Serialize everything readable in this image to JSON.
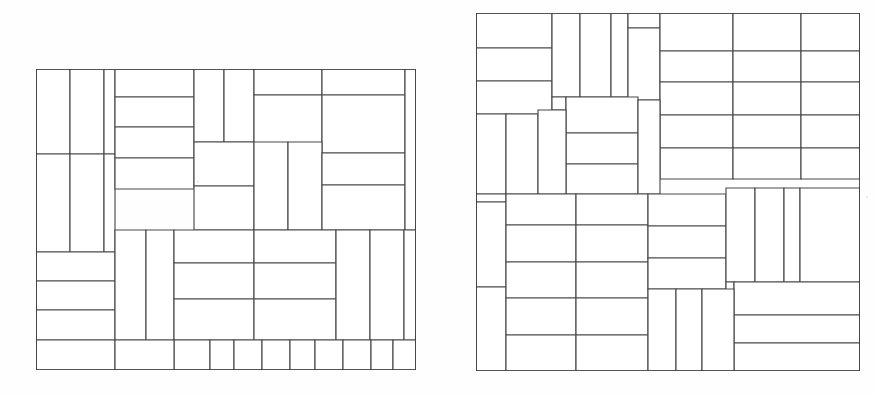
{
  "page": {
    "background_color": "#fefefe",
    "line_color": "#4a4a4a",
    "outline_color": "#3a3a3a",
    "fill_color": "#ffffff",
    "width": 876,
    "height": 395
  },
  "figures": [
    {
      "name": "left-packing",
      "label": "",
      "frame": {
        "x": 36,
        "y": 69,
        "width": 380,
        "height": 301
      },
      "view": {
        "width": 380,
        "height": 301
      },
      "piece_count": 38,
      "pieces": [
        {
          "x": 0,
          "y": 0,
          "w": 34,
          "h": 85
        },
        {
          "x": 34,
          "y": 0,
          "w": 34,
          "h": 85
        },
        {
          "x": 68,
          "y": 0,
          "w": 11,
          "h": 85
        },
        {
          "x": 0,
          "y": 85,
          "w": 34,
          "h": 98
        },
        {
          "x": 34,
          "y": 85,
          "w": 34,
          "h": 98
        },
        {
          "x": 68,
          "y": 85,
          "w": 11,
          "h": 98
        },
        {
          "x": 79,
          "y": 0,
          "w": 79,
          "h": 28
        },
        {
          "x": 79,
          "y": 28,
          "w": 79,
          "h": 30
        },
        {
          "x": 79,
          "y": 58,
          "w": 79,
          "h": 31
        },
        {
          "x": 79,
          "y": 89,
          "w": 79,
          "h": 31
        },
        {
          "x": 158,
          "y": 0,
          "w": 30,
          "h": 73
        },
        {
          "x": 188,
          "y": 0,
          "w": 30,
          "h": 73
        },
        {
          "x": 218,
          "y": 0,
          "w": 68,
          "h": 26
        },
        {
          "x": 218,
          "y": 26,
          "w": 68,
          "h": 58
        },
        {
          "x": 286,
          "y": 0,
          "w": 83,
          "h": 26
        },
        {
          "x": 286,
          "y": 26,
          "w": 83,
          "h": 58
        },
        {
          "x": 158,
          "y": 73,
          "w": 60,
          "h": 44
        },
        {
          "x": 158,
          "y": 117,
          "w": 60,
          "h": 44
        },
        {
          "x": 218,
          "y": 73,
          "w": 34,
          "h": 88
        },
        {
          "x": 252,
          "y": 73,
          "w": 34,
          "h": 88
        },
        {
          "x": 286,
          "y": 84,
          "w": 83,
          "h": 32
        },
        {
          "x": 286,
          "y": 116,
          "w": 83,
          "h": 45
        },
        {
          "x": 369,
          "y": 0,
          "w": 11,
          "h": 161
        },
        {
          "x": 0,
          "y": 183,
          "w": 79,
          "h": 29
        },
        {
          "x": 0,
          "y": 212,
          "w": 79,
          "h": 29
        },
        {
          "x": 0,
          "y": 241,
          "w": 79,
          "h": 30
        },
        {
          "x": 0,
          "y": 271,
          "w": 79,
          "h": 30
        },
        {
          "x": 79,
          "y": 161,
          "w": 31,
          "h": 110
        },
        {
          "x": 110,
          "y": 161,
          "w": 28,
          "h": 110
        },
        {
          "x": 138,
          "y": 161,
          "w": 80,
          "h": 33
        },
        {
          "x": 138,
          "y": 194,
          "w": 80,
          "h": 36
        },
        {
          "x": 138,
          "y": 230,
          "w": 80,
          "h": 41
        },
        {
          "x": 218,
          "y": 161,
          "w": 82,
          "h": 33
        },
        {
          "x": 218,
          "y": 194,
          "w": 82,
          "h": 36
        },
        {
          "x": 218,
          "y": 230,
          "w": 82,
          "h": 41
        },
        {
          "x": 300,
          "y": 161,
          "w": 34,
          "h": 110
        },
        {
          "x": 334,
          "y": 161,
          "w": 34,
          "h": 110
        },
        {
          "x": 368,
          "y": 161,
          "w": 12,
          "h": 110
        },
        {
          "x": 138,
          "y": 271,
          "w": 36,
          "h": 30
        },
        {
          "x": 174,
          "y": 271,
          "w": 24,
          "h": 30
        },
        {
          "x": 198,
          "y": 271,
          "w": 28,
          "h": 30
        },
        {
          "x": 226,
          "y": 271,
          "w": 28,
          "h": 30
        },
        {
          "x": 254,
          "y": 271,
          "w": 25,
          "h": 30
        },
        {
          "x": 279,
          "y": 271,
          "w": 28,
          "h": 30
        },
        {
          "x": 307,
          "y": 271,
          "w": 28,
          "h": 30
        },
        {
          "x": 335,
          "y": 271,
          "w": 22,
          "h": 30
        },
        {
          "x": 357,
          "y": 271,
          "w": 23,
          "h": 30
        },
        {
          "x": 79,
          "y": 271,
          "w": 59,
          "h": 30
        }
      ]
    },
    {
      "name": "right-packing",
      "label": "",
      "frame": {
        "x": 476,
        "y": 13,
        "width": 384,
        "height": 358
      },
      "view": {
        "width": 384,
        "height": 358
      },
      "piece_count": 44,
      "pieces": [
        {
          "x": 0,
          "y": 0,
          "w": 76,
          "h": 35
        },
        {
          "x": 0,
          "y": 35,
          "w": 76,
          "h": 33
        },
        {
          "x": 0,
          "y": 68,
          "w": 76,
          "h": 33
        },
        {
          "x": 76,
          "y": 0,
          "w": 28,
          "h": 84
        },
        {
          "x": 104,
          "y": 0,
          "w": 31,
          "h": 84
        },
        {
          "x": 135,
          "y": 0,
          "w": 17,
          "h": 84
        },
        {
          "x": 152,
          "y": 0,
          "w": 32,
          "h": 15
        },
        {
          "x": 152,
          "y": 15,
          "w": 32,
          "h": 72
        },
        {
          "x": 184,
          "y": 0,
          "w": 73,
          "h": 38
        },
        {
          "x": 257,
          "y": 0,
          "w": 68,
          "h": 38
        },
        {
          "x": 325,
          "y": 0,
          "w": 59,
          "h": 38
        },
        {
          "x": 184,
          "y": 38,
          "w": 73,
          "h": 31
        },
        {
          "x": 257,
          "y": 38,
          "w": 68,
          "h": 31
        },
        {
          "x": 325,
          "y": 38,
          "w": 59,
          "h": 31
        },
        {
          "x": 184,
          "y": 69,
          "w": 73,
          "h": 33
        },
        {
          "x": 257,
          "y": 69,
          "w": 68,
          "h": 33
        },
        {
          "x": 325,
          "y": 69,
          "w": 59,
          "h": 33
        },
        {
          "x": 184,
          "y": 102,
          "w": 73,
          "h": 33
        },
        {
          "x": 257,
          "y": 102,
          "w": 68,
          "h": 33
        },
        {
          "x": 325,
          "y": 102,
          "w": 59,
          "h": 33
        },
        {
          "x": 184,
          "y": 135,
          "w": 73,
          "h": 31
        },
        {
          "x": 257,
          "y": 135,
          "w": 68,
          "h": 31
        },
        {
          "x": 325,
          "y": 135,
          "w": 59,
          "h": 31
        },
        {
          "x": 76,
          "y": 84,
          "w": 14,
          "h": 13
        },
        {
          "x": 90,
          "y": 84,
          "w": 72,
          "h": 36
        },
        {
          "x": 90,
          "y": 120,
          "w": 72,
          "h": 31
        },
        {
          "x": 90,
          "y": 151,
          "w": 72,
          "h": 30
        },
        {
          "x": 162,
          "y": 87,
          "w": 22,
          "h": 94
        },
        {
          "x": 0,
          "y": 101,
          "w": 30,
          "h": 80
        },
        {
          "x": 30,
          "y": 101,
          "w": 32,
          "h": 80
        },
        {
          "x": 62,
          "y": 97,
          "w": 28,
          "h": 84
        },
        {
          "x": 0,
          "y": 181,
          "w": 30,
          "h": 8
        },
        {
          "x": 0,
          "y": 189,
          "w": 30,
          "h": 85
        },
        {
          "x": 0,
          "y": 274,
          "w": 30,
          "h": 84
        },
        {
          "x": 30,
          "y": 181,
          "w": 70,
          "h": 31
        },
        {
          "x": 100,
          "y": 181,
          "w": 72,
          "h": 31
        },
        {
          "x": 30,
          "y": 212,
          "w": 70,
          "h": 37
        },
        {
          "x": 100,
          "y": 212,
          "w": 72,
          "h": 37
        },
        {
          "x": 30,
          "y": 249,
          "w": 70,
          "h": 36
        },
        {
          "x": 100,
          "y": 249,
          "w": 72,
          "h": 36
        },
        {
          "x": 30,
          "y": 285,
          "w": 70,
          "h": 37
        },
        {
          "x": 100,
          "y": 285,
          "w": 72,
          "h": 37
        },
        {
          "x": 30,
          "y": 322,
          "w": 70,
          "h": 36
        },
        {
          "x": 100,
          "y": 322,
          "w": 72,
          "h": 36
        },
        {
          "x": 172,
          "y": 181,
          "w": 78,
          "h": 32
        },
        {
          "x": 172,
          "y": 213,
          "w": 78,
          "h": 32
        },
        {
          "x": 172,
          "y": 245,
          "w": 78,
          "h": 31
        },
        {
          "x": 250,
          "y": 175,
          "w": 29,
          "h": 94
        },
        {
          "x": 279,
          "y": 175,
          "w": 29,
          "h": 94
        },
        {
          "x": 308,
          "y": 175,
          "w": 16,
          "h": 94
        },
        {
          "x": 324,
          "y": 175,
          "w": 60,
          "h": 94
        },
        {
          "x": 250,
          "y": 269,
          "w": 8,
          "h": 18
        },
        {
          "x": 258,
          "y": 269,
          "w": 126,
          "h": 33
        },
        {
          "x": 258,
          "y": 302,
          "w": 126,
          "h": 28
        },
        {
          "x": 258,
          "y": 330,
          "w": 126,
          "h": 28
        },
        {
          "x": 172,
          "y": 276,
          "w": 28,
          "h": 82
        },
        {
          "x": 200,
          "y": 276,
          "w": 26,
          "h": 82
        },
        {
          "x": 226,
          "y": 276,
          "w": 32,
          "h": 82
        }
      ]
    }
  ],
  "specks": [
    {
      "x": 197,
      "y": 181,
      "size": 2
    },
    {
      "x": 866,
      "y": 196,
      "size": 2
    }
  ]
}
